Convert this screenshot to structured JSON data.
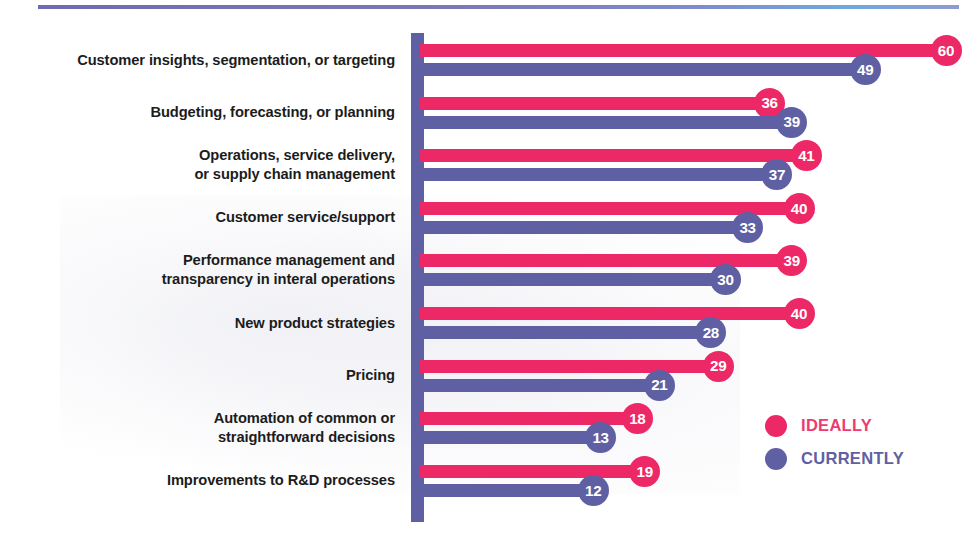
{
  "decor": {
    "top_rule_gradient_from": "#6f6bb0",
    "top_rule_gradient_to": "#6fa8dd"
  },
  "legend": {
    "position": "bottom-right",
    "items": [
      {
        "key": "ideally",
        "label": "IDEALLY",
        "color": "#ed2866"
      },
      {
        "key": "currently",
        "label": "CURRENTLY",
        "color": "#5f60a3"
      }
    ]
  },
  "chart_data": {
    "type": "bar",
    "orientation": "horizontal",
    "title": "",
    "subtitle": "",
    "xlabel": "",
    "ylabel": "",
    "xlim": [
      0,
      60
    ],
    "grid": false,
    "legend_position": "bottom-right",
    "value_labels": true,
    "categories": [
      "Customer insights, segmentation, or targeting",
      "Budgeting, forecasting, or planning",
      "Operations, service delivery,\nor supply chain management",
      "Customer service/support",
      "Performance management and\ntransparency in interal operations",
      "New product strategies",
      "Pricing",
      "Automation of common or\nstraightforward decisions",
      "Improvements to R&D processes"
    ],
    "series": [
      {
        "name": "IDEALLY",
        "color": "#ed2866",
        "values": [
          60,
          36,
          41,
          40,
          39,
          40,
          29,
          18,
          19
        ]
      },
      {
        "name": "CURRENTLY",
        "color": "#5f60a3",
        "values": [
          49,
          39,
          37,
          33,
          30,
          28,
          21,
          13,
          12
        ]
      }
    ]
  }
}
